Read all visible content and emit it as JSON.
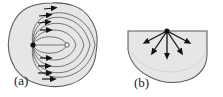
{
  "figure": {
    "type": "scientific-diagram",
    "background_color": "#ffffff",
    "region_fill_color": "#e6e6e6",
    "region_stroke_color": "#5a5a5a",
    "field_line_color": "#6b6b6b",
    "arrow_color": "#111111",
    "panels": [
      {
        "id": "a",
        "label": "(a)",
        "label_x": 14,
        "label_y": 85,
        "source_marker": "filled-dot",
        "sink_marker": "open-circle",
        "field_line_count": 5,
        "arrow_count_upper": 4,
        "arrow_count_lower": 4
      },
      {
        "id": "b",
        "label": "(b)",
        "label_x": 22,
        "label_y": 87,
        "source_marker": "filled-dot",
        "arrow_count": 5,
        "arrow_angles_deg": [
          208,
          232,
          270,
          308,
          332
        ]
      }
    ]
  }
}
